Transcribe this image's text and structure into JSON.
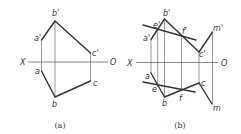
{
  "figures": [
    {
      "id": "a",
      "caption": "(a)",
      "caption_pos": [
        60,
        128
      ],
      "axis": {
        "x1": 28,
        "x2": 108,
        "y": 62,
        "left_label": "X",
        "right_label": "O",
        "left_label_pos": [
          20,
          65
        ],
        "right_label_pos": [
          110,
          65
        ]
      },
      "points": {
        "b_prime": {
          "label": "b'",
          "xy": [
            55,
            21
          ],
          "label_pos": [
            52,
            16
          ]
        },
        "a_prime": {
          "label": "a'",
          "xy": [
            41.5,
            40
          ],
          "label_pos": [
            34,
            41
          ]
        },
        "c_prime": {
          "label": "c'",
          "xy": [
            90.5,
            53
          ],
          "label_pos": [
            92,
            56
          ]
        },
        "a": {
          "label": "a",
          "xy": [
            41.5,
            71
          ],
          "label_pos": [
            35,
            74
          ]
        },
        "b": {
          "label": "b",
          "xy": [
            55,
            97
          ],
          "label_pos": [
            52,
            107
          ]
        },
        "c": {
          "label": "c",
          "xy": [
            90.5,
            81
          ],
          "label_pos": [
            93,
            86
          ]
        }
      },
      "thick_lines": [
        [
          [
            41.5,
            40
          ],
          [
            55,
            21
          ]
        ],
        [
          [
            55,
            21
          ],
          [
            90.5,
            53
          ]
        ],
        [
          [
            41.5,
            71
          ],
          [
            55,
            97
          ]
        ],
        [
          [
            55,
            97
          ],
          [
            90.5,
            81
          ]
        ]
      ],
      "thin_lines": [
        [
          [
            41.5,
            40
          ],
          [
            41.5,
            71
          ]
        ],
        [
          [
            55,
            21
          ],
          [
            55,
            97
          ]
        ],
        [
          [
            90.5,
            53
          ],
          [
            90.5,
            81
          ]
        ]
      ]
    },
    {
      "id": "b",
      "caption": "(b)",
      "caption_pos": [
        180,
        128
      ],
      "axis": {
        "x1": 136,
        "x2": 218,
        "y": 62.5,
        "left_label": "X",
        "right_label": "O",
        "left_label_pos": [
          127,
          65.5
        ],
        "right_label_pos": [
          221,
          65.5
        ]
      },
      "points": {
        "b_prime": {
          "label": "b'",
          "xy": [
            164.5,
            19
          ],
          "label_pos": [
            163,
            16
          ]
        },
        "e_prime": {
          "label": "e'",
          "xy": [
            157.7,
            29
          ],
          "label_pos": [
            153,
            28
          ]
        },
        "a_prime": {
          "label": "a'",
          "xy": [
            151,
            39.5
          ],
          "label_pos": [
            143,
            41
          ]
        },
        "f_prime": {
          "label": "f'",
          "xy": [
            181.5,
            36
          ],
          "label_pos": [
            182,
            34
          ]
        },
        "c_prime": {
          "label": "c'",
          "xy": [
            199,
            52
          ],
          "label_pos": [
            199,
            57
          ]
        },
        "m_prime": {
          "label": "m'",
          "xy": [
            212.5,
            32
          ],
          "label_pos": [
            213,
            31
          ]
        },
        "a": {
          "label": "a",
          "xy": [
            151,
            73
          ],
          "label_pos": [
            145,
            79
          ]
        },
        "e": {
          "label": "e",
          "xy": [
            158,
            87
          ],
          "label_pos": [
            152,
            92
          ]
        },
        "b": {
          "label": "b",
          "xy": [
            164.5,
            97
          ],
          "label_pos": [
            162,
            106
          ]
        },
        "f": {
          "label": "f",
          "xy": [
            181,
            89
          ],
          "label_pos": [
            179,
            101
          ]
        },
        "c": {
          "label": "c",
          "xy": [
            199,
            83
          ],
          "label_pos": [
            201,
            86
          ]
        },
        "m": {
          "label": "m",
          "xy": [
            212,
            104
          ],
          "label_pos": [
            213,
            111
          ]
        }
      },
      "thick_lines": [
        [
          [
            151,
            39.5
          ],
          [
            164.5,
            19
          ]
        ],
        [
          [
            164.5,
            19
          ],
          [
            199,
            52
          ]
        ],
        [
          [
            199,
            52
          ],
          [
            212.5,
            32
          ]
        ],
        [
          [
            143,
            25
          ],
          [
            196,
            40
          ]
        ],
        [
          [
            151,
            73
          ],
          [
            164.5,
            97
          ]
        ],
        [
          [
            164.5,
            97
          ],
          [
            199,
            83
          ]
        ],
        [
          [
            199,
            83
          ],
          [
            212,
            104
          ]
        ],
        [
          [
            143,
            82
          ],
          [
            195,
            92
          ]
        ]
      ],
      "thin_lines": [
        [
          [
            151,
            39.5
          ],
          [
            151,
            73
          ]
        ],
        [
          [
            157.7,
            29
          ],
          [
            157.7,
            87
          ]
        ],
        [
          [
            164.5,
            19
          ],
          [
            164.5,
            97
          ]
        ],
        [
          [
            181.5,
            36
          ],
          [
            181.5,
            89
          ]
        ],
        [
          [
            199,
            52
          ],
          [
            199,
            83
          ]
        ],
        [
          [
            212.5,
            32
          ],
          [
            212.5,
            104
          ]
        ]
      ]
    }
  ],
  "colors": {
    "stroke": "#333333",
    "thin_stroke": "#555555",
    "background": "#ffffff"
  }
}
